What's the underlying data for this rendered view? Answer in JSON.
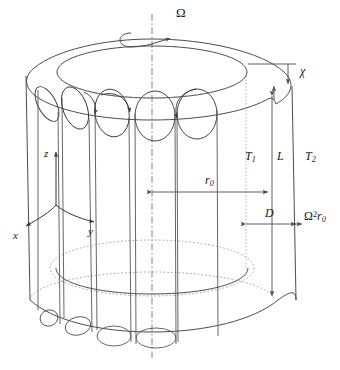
{
  "figure": {
    "name": "rotating-cylindrical-annulus-convection-diagram",
    "colors": {
      "line": "#4d4d4d",
      "line_dark": "#333333",
      "hidden_line": "#8c8c8c",
      "axis_line": "#666666",
      "text": "#1a1a1a",
      "background": "#ffffff"
    }
  },
  "labels": {
    "rotation_rate": "Ω",
    "gap_width_top": "χ",
    "inner_temperature": "T",
    "inner_temperature_sub": "1",
    "outer_temperature": "T",
    "outer_temperature_sub": "2",
    "height": "L",
    "radius": "r",
    "radius_sub": "0",
    "gap_width": "D",
    "centrifugal_accel": "Ω",
    "centrifugal_accel_sup": "2",
    "centrifugal_accel_r": "r",
    "centrifugal_accel_sub": "0",
    "axis_x": "x",
    "axis_y": "y",
    "axis_z": "z"
  },
  "geometry": {
    "roll_cell_count": 5,
    "rotation_axis": "vertical dash-dot centerline",
    "cylinder_outer_visible": true,
    "cylinder_inner_visible": true
  }
}
